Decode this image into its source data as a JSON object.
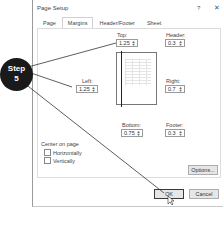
{
  "dialog": {
    "title": "Page Setup",
    "help_label": "?",
    "close_label": "✕",
    "tabs": [
      {
        "label": "Page",
        "active": false
      },
      {
        "label": "Margins",
        "active": true
      },
      {
        "label": "Header/Footer",
        "active": false
      },
      {
        "label": "Sheet",
        "active": false
      }
    ],
    "margins": {
      "top": {
        "label": "Top:",
        "value": "1.25"
      },
      "header": {
        "label": "Header:",
        "value": "0.3"
      },
      "left": {
        "label": "Left:",
        "value": "1.25"
      },
      "right": {
        "label": "Right:",
        "value": "0.7"
      },
      "bottom": {
        "label": "Bottom:",
        "value": "0.75"
      },
      "footer": {
        "label": "Footer:",
        "value": "0.3"
      }
    },
    "center_on_page": {
      "label": "Center on page",
      "horizontally": {
        "label": "Horizontally",
        "checked": false
      },
      "vertically": {
        "label": "Vertically",
        "checked": false
      }
    },
    "buttons": {
      "options": "Options...",
      "ok": "OK",
      "cancel": "Cancel"
    }
  },
  "callout": {
    "line1": "Step",
    "line2": "5",
    "color": "#1a1a1a"
  }
}
